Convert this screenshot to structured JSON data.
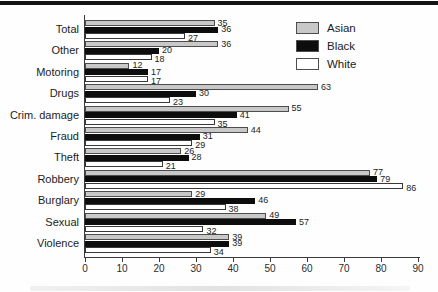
{
  "chart_data": {
    "type": "bar",
    "orientation": "horizontal",
    "title": "",
    "xlabel": "",
    "ylabel": "",
    "xlim": [
      0,
      90
    ],
    "xticks": [
      0,
      10,
      20,
      30,
      40,
      50,
      60,
      70,
      80,
      90
    ],
    "grid": false,
    "bar_value_labels": true,
    "legend_position": "top-right",
    "categories": [
      "Total",
      "Other",
      "Motoring",
      "Drugs",
      "Crim. damage",
      "Fraud",
      "Theft",
      "Robbery",
      "Burglary",
      "Sexual",
      "Violence"
    ],
    "series": [
      {
        "name": "Asian",
        "color": "#c8c8c8",
        "values": [
          35,
          36,
          12,
          63,
          55,
          44,
          26,
          77,
          29,
          49,
          39
        ]
      },
      {
        "name": "Black",
        "color": "#0d0d0d",
        "values": [
          36,
          20,
          17,
          30,
          41,
          31,
          28,
          79,
          46,
          57,
          39
        ]
      },
      {
        "name": "White",
        "color": "#ffffff",
        "values": [
          27,
          18,
          17,
          23,
          35,
          29,
          21,
          86,
          38,
          32,
          34
        ]
      }
    ]
  },
  "legend": {
    "entries": [
      {
        "label": "Asian",
        "color": "#c8c8c8"
      },
      {
        "label": "Black",
        "color": "#0d0d0d"
      },
      {
        "label": "White",
        "color": "#ffffff"
      }
    ]
  },
  "colors": {
    "background": "#fefefe",
    "axis": "#3a3a3a",
    "text": "#1c1c1c",
    "top_rule": "#141414"
  }
}
